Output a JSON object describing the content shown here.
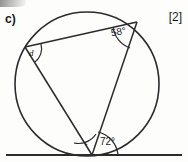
{
  "question": {
    "label": "c)",
    "marks": "[2]"
  },
  "figure": {
    "type": "circle-theorem-diagram",
    "circle": {
      "cx": 87,
      "cy": 84,
      "r": 72
    },
    "tangent_line": {
      "y": 155,
      "x_start": 6,
      "x_end": 182
    },
    "vertices": {
      "left": {
        "x": 25,
        "y": 47
      },
      "top_right": {
        "x": 137,
        "y": 22
      },
      "bottom": {
        "x": 92,
        "y": 155
      }
    },
    "angles": [
      {
        "name": "angle-58",
        "value": "58°",
        "vertex": "top-right",
        "known": true
      },
      {
        "name": "angle-72",
        "value": "72°",
        "vertex": "bottom-tangent",
        "known": true
      },
      {
        "name": "angle-c",
        "value": "c",
        "vertex": "bottom",
        "known": false
      },
      {
        "name": "angle-d",
        "value": "d",
        "vertex": "left",
        "known": false
      }
    ],
    "colors": {
      "ink": "#17171a",
      "stroke": "#2b2b2e",
      "paper": "#fdfdfc"
    }
  }
}
